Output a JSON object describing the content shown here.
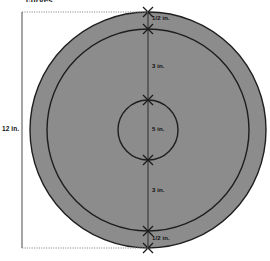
{
  "figure": {
    "title": "curves.",
    "type": "concentric-circle-target-diagram",
    "colors": {
      "fill": "#8c8c8c",
      "stroke": "#1a1a1a",
      "background": "#ffffff",
      "dimension_line": "#555555",
      "extension_line": "#9a9a9a"
    },
    "geometry": {
      "center_x": 148,
      "center_y": 130,
      "outer_radius": 118,
      "middle_radius": 101,
      "inner_radius": 30,
      "top_y": 12,
      "bottom_y": 248
    },
    "overall_dimension": {
      "label": "12 in.",
      "orientation": "vertical",
      "x": 22
    },
    "segment_labels": [
      {
        "id": "top-half-inch",
        "text": "1/2 in.",
        "x": 152,
        "y": 18
      },
      {
        "id": "top-three-inch",
        "text": "3 in.",
        "x": 152,
        "y": 66
      },
      {
        "id": "center-five-inch",
        "text": "5 in.",
        "x": 152,
        "y": 128
      },
      {
        "id": "bottom-three-inch",
        "text": "3 in.",
        "x": 152,
        "y": 190
      },
      {
        "id": "bottom-half-inch",
        "text": "1/2 in.",
        "x": 152,
        "y": 238
      }
    ],
    "tick_marks": [
      {
        "id": "tick-outer-top",
        "x": 148,
        "y": 12
      },
      {
        "id": "tick-middle-top",
        "x": 148,
        "y": 29
      },
      {
        "id": "tick-inner-top",
        "x": 148,
        "y": 100
      },
      {
        "id": "tick-inner-bottom",
        "x": 148,
        "y": 160
      },
      {
        "id": "tick-middle-bottom",
        "x": 148,
        "y": 231
      },
      {
        "id": "tick-outer-bottom",
        "x": 148,
        "y": 248
      }
    ]
  }
}
